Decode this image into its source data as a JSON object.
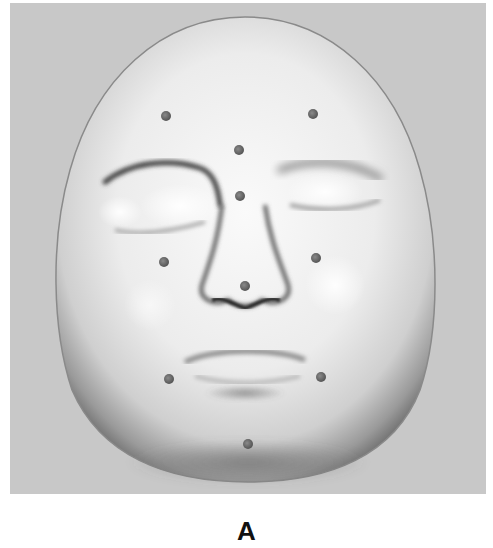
{
  "figure": {
    "panel_label": "A",
    "colors": {
      "background": "#c8c8c8",
      "face_light": "#f6f6f6",
      "face_shadow": "#6e6e6e",
      "landmark": "#6a6a6a"
    },
    "landmarks": [
      {
        "name": "forehead-left",
        "x": 166,
        "y": 116
      },
      {
        "name": "forehead-right",
        "x": 313,
        "y": 114
      },
      {
        "name": "glabella",
        "x": 239,
        "y": 150
      },
      {
        "name": "nasion",
        "x": 240,
        "y": 196
      },
      {
        "name": "cheek-left",
        "x": 164,
        "y": 262
      },
      {
        "name": "cheek-right",
        "x": 316,
        "y": 258
      },
      {
        "name": "nose-tip",
        "x": 245,
        "y": 286
      },
      {
        "name": "mouth-corner-left",
        "x": 169,
        "y": 379
      },
      {
        "name": "mouth-corner-right",
        "x": 321,
        "y": 377
      },
      {
        "name": "chin",
        "x": 248,
        "y": 444
      }
    ]
  }
}
